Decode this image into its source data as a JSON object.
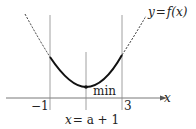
{
  "diagram": {
    "type": "parabola-minimum-on-interval",
    "curve_label": "y = f(x)",
    "axis_label": "x",
    "ticks": [
      {
        "label": "−1"
      },
      {
        "label": "3"
      }
    ],
    "vertex_label": "min",
    "axis_of_symmetry_label": "x = a + 1",
    "colors": {
      "curve": "#111111",
      "dashed": "#333333",
      "guides": "#888888",
      "axis": "#555555"
    }
  },
  "text": {
    "y_eq": "y",
    "eq": "=",
    "f_of_x": "f(x)",
    "x_axis": "x",
    "tick_left": "−1",
    "tick_right": "3",
    "min": "min",
    "sym_x": "x",
    "sym_rest": "= a + 1"
  }
}
